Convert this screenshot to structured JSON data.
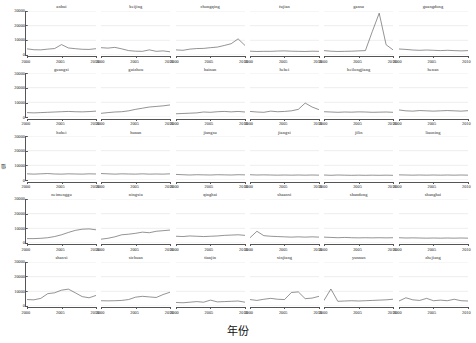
{
  "chart_data": {
    "type": "line",
    "title": "",
    "xlabel": "年份",
    "ylabel": "值",
    "xlim": [
      2000,
      2010
    ],
    "ylim": [
      0,
      30000
    ],
    "xticks": [
      2000,
      2005,
      2010
    ],
    "ytick_labels": [
      "0",
      "10000",
      "20000",
      "30000"
    ],
    "yticks": [
      0,
      10000,
      20000,
      30000
    ],
    "grid": true,
    "legend": "none",
    "layout": {
      "rows": 5,
      "cols": 6
    },
    "x": [
      2000,
      2001,
      2002,
      2003,
      2004,
      2005,
      2006,
      2007,
      2008,
      2009,
      2010
    ],
    "line_color": "#3a3a3a",
    "grid_color": "#d8d8d8",
    "axis_color": "#555555",
    "panels": [
      {
        "name": "anhui",
        "values": [
          4200,
          3600,
          3500,
          4000,
          4400,
          7100,
          4800,
          4300,
          3900,
          3800,
          4300
        ]
      },
      {
        "name": "beijing",
        "values": [
          5000,
          4700,
          5200,
          4200,
          3000,
          2600,
          2500,
          3500,
          2500,
          2800,
          2200
        ]
      },
      {
        "name": "chongqing",
        "values": [
          3500,
          3200,
          4000,
          4400,
          4500,
          5000,
          5400,
          6500,
          7700,
          11000,
          6500
        ]
      },
      {
        "name": "fujian",
        "values": [
          2600,
          2400,
          2500,
          2500,
          2700,
          2800,
          2600,
          2500,
          2400,
          2600,
          2500
        ]
      },
      {
        "name": "gansu",
        "values": [
          3000,
          2600,
          2400,
          2500,
          2600,
          2800,
          3000,
          16000,
          28500,
          7000,
          3500
        ]
      },
      {
        "name": "guangdong",
        "values": [
          4100,
          3800,
          3400,
          3200,
          3400,
          3200,
          3000,
          3200,
          3000,
          2800,
          3000
        ]
      },
      {
        "name": "guangxi",
        "values": [
          3000,
          2800,
          3000,
          3200,
          3400,
          3600,
          3800,
          3600,
          3500,
          3700,
          4000
        ]
      },
      {
        "name": "guizhou",
        "values": [
          2500,
          3000,
          3400,
          3600,
          4200,
          5200,
          6000,
          6800,
          7200,
          7600,
          8200
        ]
      },
      {
        "name": "hainan",
        "values": [
          2200,
          2400,
          2600,
          2800,
          3400,
          3200,
          3600,
          3800,
          3500,
          3800,
          3400
        ]
      },
      {
        "name": "hebei",
        "values": [
          3800,
          3400,
          3200,
          4000,
          3600,
          3800,
          4200,
          5200,
          9500,
          6800,
          5000
        ]
      },
      {
        "name": "heilongjiang",
        "values": [
          3600,
          3400,
          3200,
          3400,
          3300,
          3500,
          3400,
          3200,
          3300,
          3400,
          3200
        ]
      },
      {
        "name": "henan",
        "values": [
          4800,
          4200,
          4000,
          4400,
          4200,
          4000,
          4200,
          4400,
          4200,
          4000,
          4300
        ]
      },
      {
        "name": "hubei",
        "values": [
          4200,
          4000,
          4200,
          4400,
          4100,
          4000,
          4200,
          4100,
          4000,
          4200,
          4100
        ]
      },
      {
        "name": "hunan",
        "values": [
          4400,
          4200,
          4000,
          4200,
          4100,
          4000,
          4200,
          4000,
          4100,
          4000,
          4200
        ]
      },
      {
        "name": "jiangsu",
        "values": [
          3800,
          3600,
          3400,
          3600,
          3500,
          3400,
          3600,
          3500,
          3400,
          3600,
          3500
        ]
      },
      {
        "name": "jiangxi",
        "values": [
          3600,
          3400,
          3500,
          3400,
          3300,
          3400,
          3300,
          3400,
          3300,
          3400,
          3300
        ]
      },
      {
        "name": "jilin",
        "values": [
          3400,
          3200,
          3400,
          3300,
          3200,
          3300,
          3200,
          3300,
          3200,
          3300,
          3200
        ]
      },
      {
        "name": "liaoning",
        "values": [
          3500,
          3400,
          3300,
          3400,
          3300,
          3400,
          3300,
          3400,
          3300,
          3400,
          3300
        ]
      },
      {
        "name": "neimenggu",
        "values": [
          3000,
          3000,
          3200,
          3600,
          4400,
          5600,
          7200,
          8600,
          9400,
          9600,
          9000
        ]
      },
      {
        "name": "ningxia",
        "values": [
          2600,
          3200,
          4200,
          5600,
          6000,
          6600,
          7400,
          7000,
          8000,
          8400,
          8800
        ]
      },
      {
        "name": "qinghai",
        "values": [
          4600,
          4400,
          4800,
          4600,
          4400,
          4600,
          4800,
          5200,
          5400,
          5600,
          5200
        ]
      },
      {
        "name": "shaanxi",
        "values": [
          3600,
          8000,
          5000,
          4600,
          4400,
          4200,
          4000,
          4200,
          4000,
          4200,
          4000
        ]
      },
      {
        "name": "shandong",
        "values": [
          4000,
          3800,
          3600,
          3800,
          3600,
          3500,
          3600,
          3500,
          3600,
          3500,
          3600
        ]
      },
      {
        "name": "shanghai",
        "values": [
          3600,
          3400,
          3500,
          3400,
          3300,
          3400,
          3300,
          3400,
          3300,
          3400,
          3300
        ]
      },
      {
        "name": "shanxi",
        "values": [
          4400,
          4200,
          5200,
          8400,
          9000,
          10800,
          11500,
          9000,
          6400,
          5600,
          7200
        ]
      },
      {
        "name": "sichuan",
        "values": [
          3600,
          3500,
          3600,
          3800,
          4400,
          6000,
          6600,
          6200,
          5800,
          7800,
          9400
        ]
      },
      {
        "name": "tianjin",
        "values": [
          2400,
          2200,
          2600,
          3000,
          2600,
          4000,
          2800,
          3000,
          3200,
          3400,
          2600
        ]
      },
      {
        "name": "xinjiang",
        "values": [
          4400,
          3800,
          4600,
          5200,
          4600,
          4400,
          9200,
          9600,
          5000,
          5400,
          6600
        ]
      },
      {
        "name": "yunnan",
        "values": [
          3800,
          11600,
          3200,
          3400,
          3600,
          3400,
          3600,
          3800,
          4000,
          4200,
          4600
        ]
      },
      {
        "name": "zhejiang",
        "values": [
          3400,
          5600,
          4200,
          3800,
          5200,
          3600,
          4000,
          3600,
          4600,
          3600,
          3400
        ]
      }
    ]
  }
}
